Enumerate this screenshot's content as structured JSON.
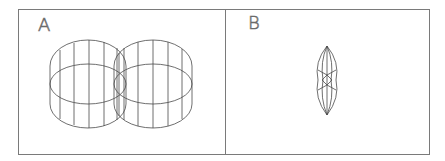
{
  "figure": {
    "panels": [
      {
        "label": "A",
        "description": "Two intersecting cylinders in wireframe (isometric view)"
      },
      {
        "label": "B",
        "description": "Intersection solid of the two cylinders (lens-shaped wireframe)"
      }
    ]
  },
  "colors": {
    "frame": "#7a7a7a",
    "wire": "#4a4a4a",
    "background": "#ffffff"
  }
}
